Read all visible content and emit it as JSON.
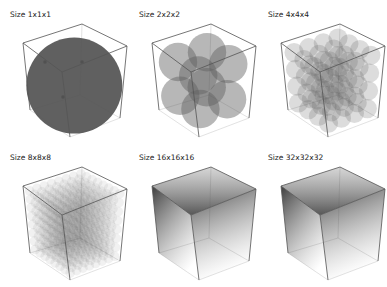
{
  "figure": {
    "panels": [
      {
        "title": "Size 1x1x1",
        "grid": 1
      },
      {
        "title": "Size 2x2x2",
        "grid": 2
      },
      {
        "title": "Size 4x4x4",
        "grid": 4
      },
      {
        "title": "Size 8x8x8",
        "grid": 8
      },
      {
        "title": "Size 16x16x16",
        "grid": 16
      },
      {
        "title": "Size 32x32x32",
        "grid": 32
      }
    ],
    "colors": {
      "sphere": "#606060",
      "edge": "#555555",
      "background": "#ffffff"
    }
  }
}
